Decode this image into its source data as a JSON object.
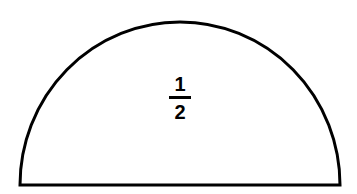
{
  "figure": {
    "name": "semicircle-with-fraction-label",
    "shape_type": "semicircle",
    "background_color": "#ffffff",
    "stroke_color": "#000000",
    "stroke_width": 3,
    "fill_color": "#ffffff",
    "geometry": {
      "center_x": 180,
      "baseline_y": 185,
      "radius": 160,
      "left_x": 20,
      "right_x": 340,
      "apex_y": 22,
      "height": 163
    },
    "label": {
      "type": "fraction",
      "numerator": "1",
      "denominator": "2",
      "text": "1/2",
      "color": "#000000"
    }
  }
}
